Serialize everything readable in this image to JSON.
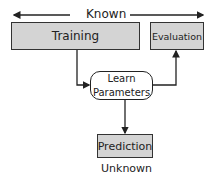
{
  "diagram": {
    "top_label": "Known",
    "bottom_label": "Unknown",
    "nodes": {
      "training": "Training",
      "evaluation": "Evaluation",
      "learn_line1": "Learn",
      "learn_line2": "Parameters",
      "prediction": "Prediction"
    },
    "edges": [
      {
        "from": "training",
        "to": "learn_parameters"
      },
      {
        "from": "learn_parameters",
        "to": "evaluation"
      },
      {
        "from": "learn_parameters",
        "to": "prediction"
      }
    ],
    "colors": {
      "box_fill": "#d4d4d4",
      "stroke": "#222222",
      "background": "#ffffff"
    }
  }
}
